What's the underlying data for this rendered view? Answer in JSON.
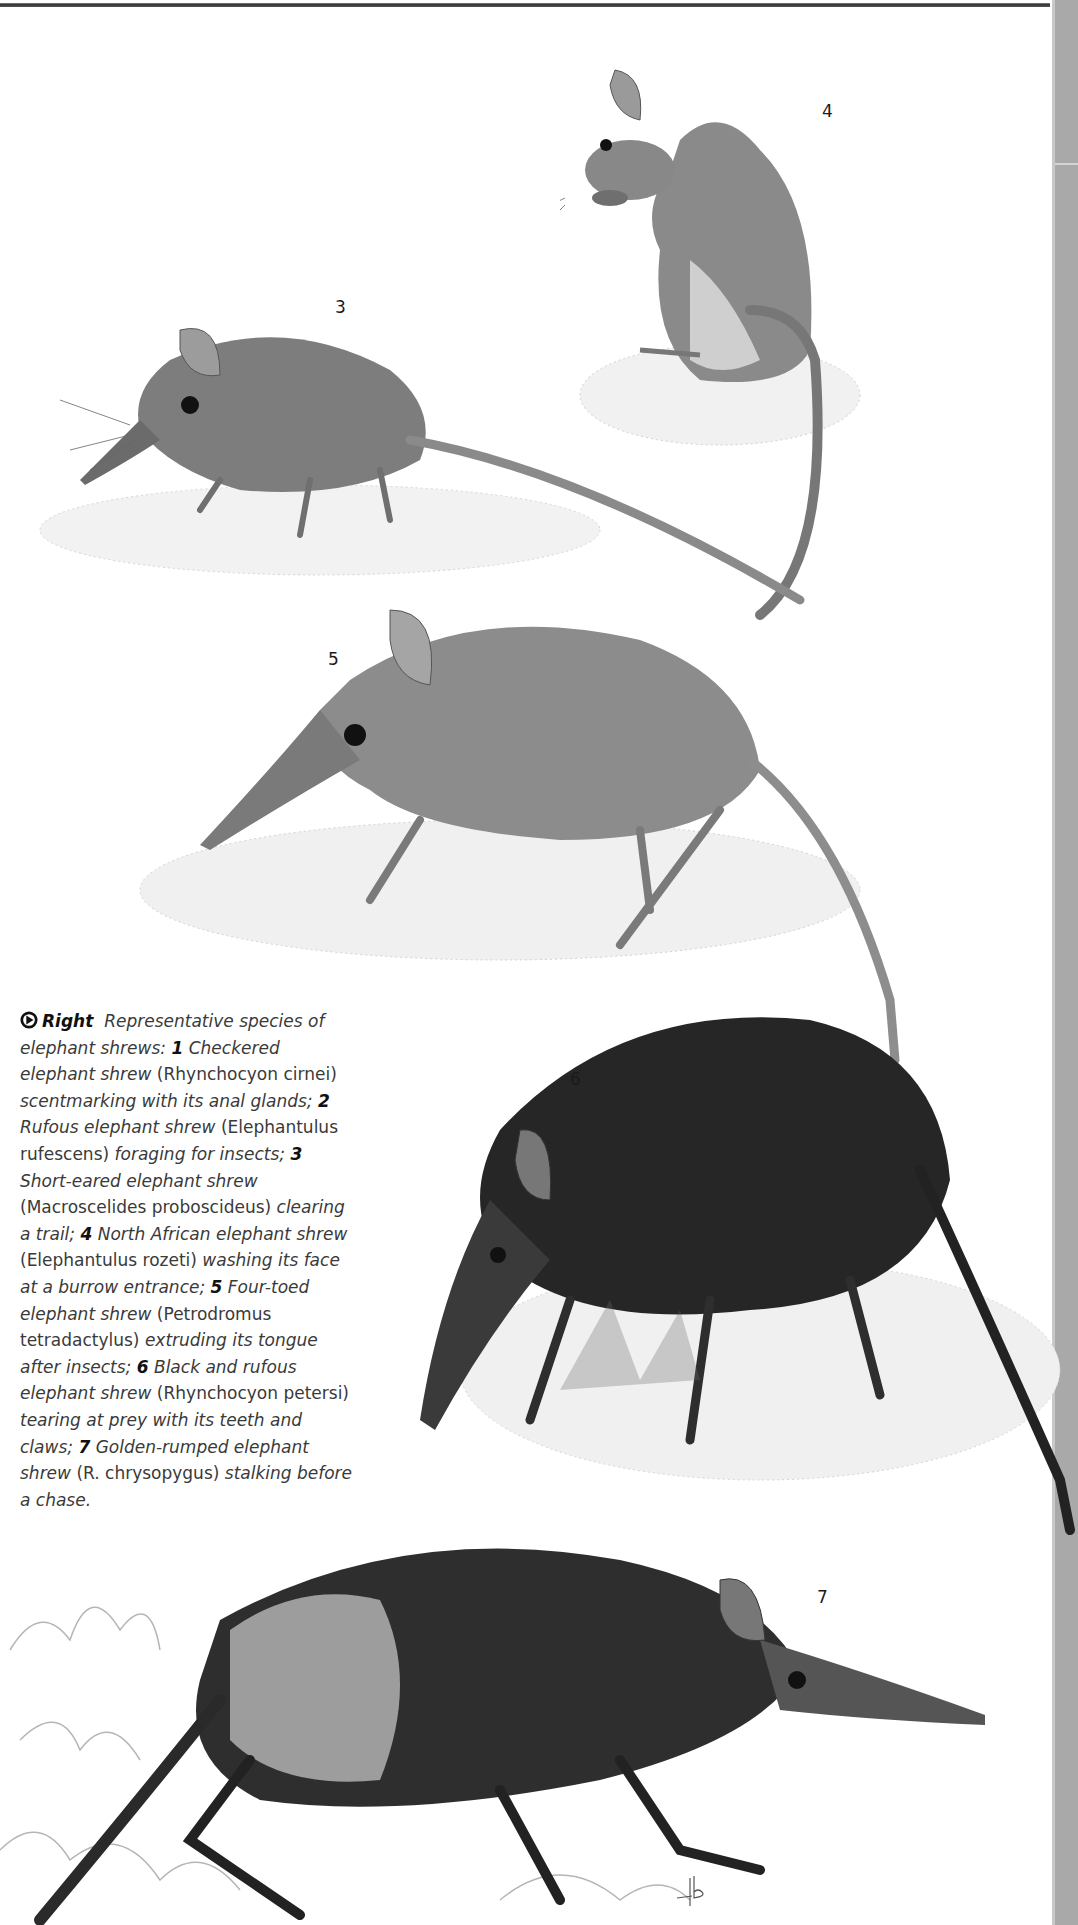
{
  "figure": {
    "plate_labels": [
      "3",
      "4",
      "5",
      "6",
      "7"
    ],
    "illustrations": [
      {
        "id": "3",
        "subject": "Short-eared elephant shrew clearing a trail"
      },
      {
        "id": "4",
        "subject": "North African elephant shrew washing its face"
      },
      {
        "id": "5",
        "subject": "Four-toed elephant shrew extruding its tongue"
      },
      {
        "id": "6",
        "subject": "Black and rufous elephant shrew tearing at prey"
      },
      {
        "id": "7",
        "subject": "Golden-rumped elephant shrew stalking"
      }
    ],
    "artist_signature": "pb"
  },
  "caption": {
    "icon": "right-arrow-circle-icon",
    "lead": "Right",
    "segments": [
      {
        "t": "i",
        "v": "Representative species of elephant shrews: "
      },
      {
        "t": "n",
        "v": "1"
      },
      {
        "t": "i",
        "v": " Checkered elephant shrew "
      },
      {
        "t": "r",
        "v": "(Rhynchocyon cirnei) "
      },
      {
        "t": "i",
        "v": "scentmarking with its anal glands; "
      },
      {
        "t": "n",
        "v": "2"
      },
      {
        "t": "i",
        "v": " Rufous elephant shrew "
      },
      {
        "t": "r",
        "v": "(Elephantulus rufescens) "
      },
      {
        "t": "i",
        "v": "foraging for insects; "
      },
      {
        "t": "n",
        "v": "3"
      },
      {
        "t": "i",
        "v": " Short-eared elephant shrew "
      },
      {
        "t": "r",
        "v": "(Macroscelides proboscideus) "
      },
      {
        "t": "i",
        "v": "clearing a trail; "
      },
      {
        "t": "n",
        "v": "4"
      },
      {
        "t": "i",
        "v": " North African elephant shrew "
      },
      {
        "t": "r",
        "v": "(Elephantulus rozeti) "
      },
      {
        "t": "i",
        "v": "washing its face at a burrow entrance; "
      },
      {
        "t": "n",
        "v": "5"
      },
      {
        "t": "i",
        "v": " Four-toed elephant shrew "
      },
      {
        "t": "r",
        "v": "(Petrodromus tetradactylus) "
      },
      {
        "t": "i",
        "v": "extruding its tongue after insects; "
      },
      {
        "t": "n",
        "v": "6"
      },
      {
        "t": "i",
        "v": " Black and rufous elephant shrew "
      },
      {
        "t": "r",
        "v": "(Rhynchocyon petersi) "
      },
      {
        "t": "i",
        "v": "tearing at prey with its teeth and claws; "
      },
      {
        "t": "n",
        "v": "7"
      },
      {
        "t": "i",
        "v": " Golden-rumped elephant shrew "
      },
      {
        "t": "r",
        "v": "(R. chrysopygus) "
      },
      {
        "t": "i",
        "v": "stalking before a chase."
      }
    ]
  }
}
